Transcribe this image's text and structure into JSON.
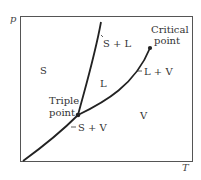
{
  "diagram": {
    "type": "phase-diagram",
    "axes": {
      "y_label": "p",
      "x_label": "T"
    },
    "regions": {
      "solid": "S",
      "liquid": "L",
      "vapor": "V"
    },
    "boundaries": {
      "solid_liquid": "S + L",
      "liquid_vapor": "L + V",
      "solid_vapor": "S + V"
    },
    "points": {
      "triple_line1": "Triple",
      "triple_line2": "point",
      "critical_line1": "Critical",
      "critical_line2": "point"
    },
    "colors": {
      "line": "#222222",
      "frame": "#555555",
      "text": "#333333"
    }
  }
}
